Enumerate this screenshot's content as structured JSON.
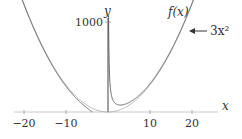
{
  "chart_data": {
    "type": "line",
    "title": "",
    "xlabel": "x",
    "ylabel": "y",
    "xlim": [
      -23,
      30
    ],
    "ylim": [
      -30,
      1250
    ],
    "x_ticks": [
      -20,
      -10,
      10,
      20
    ],
    "x_tick_labels": [
      "−20",
      "−10",
      "10",
      "20"
    ],
    "y_ticks": [
      1000
    ],
    "y_tick_labels": [
      "1000"
    ],
    "grid": false,
    "series": [
      {
        "name": "f(x)",
        "formula": "3x^2 + 150/x",
        "coefficient": 3,
        "c": 150,
        "color": "#555555",
        "label": "f(x)"
      },
      {
        "name": "3x^2",
        "formula": "3x^2",
        "coefficient": 3,
        "color": "#aaaaaa",
        "label": "3x²"
      }
    ],
    "annotations": [
      {
        "text": "f(x)",
        "target": "f(x)"
      },
      {
        "text": "3x²",
        "target": "3x^2",
        "arrow": "left"
      }
    ]
  }
}
